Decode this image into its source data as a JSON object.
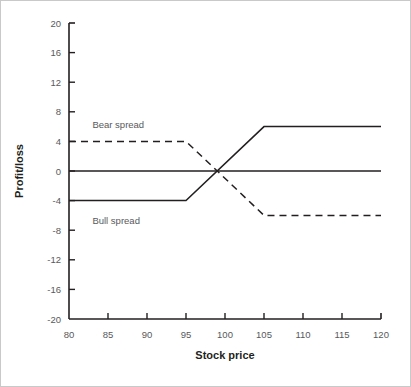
{
  "chart_data": {
    "type": "line",
    "title": "",
    "xlabel": "Stock price",
    "ylabel": "Profit/loss",
    "xlim": [
      80,
      120
    ],
    "ylim": [
      -20,
      20
    ],
    "xticks": [
      80,
      85,
      90,
      95,
      100,
      105,
      110,
      115,
      120
    ],
    "yticks": [
      20,
      16,
      12,
      8,
      4,
      0,
      -4,
      -8,
      -12,
      -16,
      -20
    ],
    "xtick_labels": [
      "80",
      "85",
      "90",
      "95",
      "100",
      "105",
      "110",
      "115",
      "120"
    ],
    "ytick_labels": [
      "20",
      "16",
      "12",
      "8",
      "4",
      "0",
      "-4",
      "-8",
      "-12",
      "-16",
      "-20"
    ],
    "grid": false,
    "legend_position": "inline-annotations",
    "zero_line": {
      "value": 0,
      "style": "solid",
      "color": "#231f20"
    },
    "series": [
      {
        "name": "Bull spread",
        "style": "solid",
        "color": "#231f20",
        "x": [
          80,
          95,
          105,
          120
        ],
        "values": [
          -4,
          -4,
          6,
          6
        ],
        "annotation": "Bull spread",
        "annotation_x": 83,
        "annotation_y": -6.8
      },
      {
        "name": "Bear spread",
        "style": "dashed",
        "color": "#231f20",
        "x": [
          80,
          95,
          105,
          120
        ],
        "values": [
          4,
          4,
          -6,
          -6
        ],
        "annotation": "Bear spread",
        "annotation_x": 83,
        "annotation_y": 6.2
      }
    ],
    "crossover": {
      "x": 99,
      "y": 0
    }
  },
  "axes": {
    "x_title": "Stock price",
    "y_title": "Profit/loss"
  },
  "annotations": {
    "bear": "Bear spread",
    "bull": "Bull spread"
  },
  "colors": {
    "line": "#231f20",
    "axis": "#231f20",
    "tick_text": "#58595b",
    "border": "#c9c9c9",
    "background": "#ffffff"
  }
}
